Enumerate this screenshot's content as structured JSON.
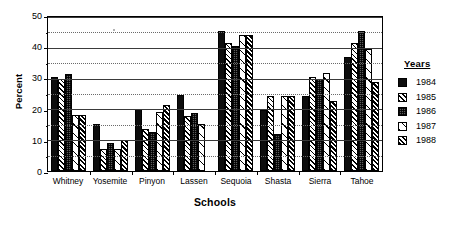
{
  "chart_data": {
    "type": "bar",
    "title": "",
    "xlabel": "Schools",
    "ylabel": "Percent",
    "ylim": [
      0,
      50
    ],
    "yticks": [
      0,
      10,
      20,
      30,
      40,
      50
    ],
    "yticks_minor": [
      5,
      15,
      25,
      35,
      45
    ],
    "grid": true,
    "legend_position": "right",
    "legend_title": "Years",
    "categories": [
      "Whitney",
      "Yosemite",
      "Pinyon",
      "Lassen",
      "Sequoia",
      "Shasta",
      "Sierra",
      "Tahoe"
    ],
    "series": [
      {
        "name": "1984",
        "pattern": "solid-black",
        "values": [
          30.0,
          15.0,
          20.0,
          24.5,
          45.0,
          19.5,
          24.0,
          36.5
        ]
      },
      {
        "name": "1985",
        "pattern": "diagonal-hatch",
        "values": [
          29.5,
          7.0,
          13.5,
          17.5,
          41.0,
          24.0,
          30.0,
          41.0
        ]
      },
      {
        "name": "1986",
        "pattern": "dotted-gray",
        "values": [
          31.0,
          9.0,
          12.5,
          18.5,
          40.0,
          12.0,
          29.5,
          45.0
        ]
      },
      {
        "name": "1987",
        "pattern": "sparse-hatch",
        "values": [
          18.0,
          7.0,
          19.0,
          15.0,
          43.5,
          24.0,
          31.5,
          39.0
        ]
      },
      {
        "name": "1988",
        "pattern": "dense-hatch",
        "values": [
          18.0,
          10.0,
          21.0,
          0.0,
          43.5,
          24.0,
          22.5,
          28.5
        ]
      }
    ]
  },
  "axes": {
    "y_title": "Percent",
    "x_title": "Schools"
  },
  "legend": {
    "title": "Years",
    "items": [
      {
        "label": "1984"
      },
      {
        "label": "1985"
      },
      {
        "label": "1986"
      },
      {
        "label": "1987"
      },
      {
        "label": "1988"
      }
    ]
  }
}
